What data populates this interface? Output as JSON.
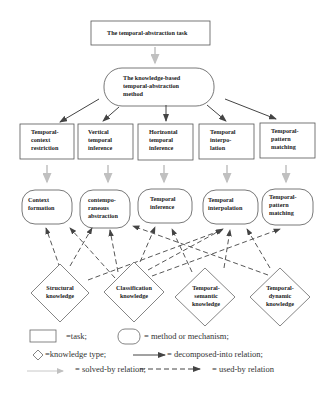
{
  "title_task": "The temporal-abstraction task",
  "method": "The knowledge-based temporal-abstraction method",
  "subtasks": [
    "Temporal-context restriction",
    "Vertical temporal inference",
    "Horizontal temporal inference",
    "Temporal interpo-lation",
    "Temporal-pattern matching"
  ],
  "mechanisms": [
    "Context formation",
    "contempo-raneous abstraction",
    "Temporal inference",
    "Temporal interpolation",
    "Temporal-pattern matching"
  ],
  "knowledge": [
    "Structural knowledge",
    "Classification knowledge",
    "Temporal-semantic knowledge",
    "Temporal-dynamic knowledge"
  ],
  "legend": {
    "task": "=task;",
    "method": "= method or mechanism;",
    "knowledge": "=knowledge type;",
    "decomposed": "= decomposed-into relation;",
    "solved": "= solved-by relation;",
    "used": "= used-by relation"
  },
  "colors": {
    "line": "#444444",
    "solved_by": "#b8b8b8",
    "border": "#555555"
  }
}
